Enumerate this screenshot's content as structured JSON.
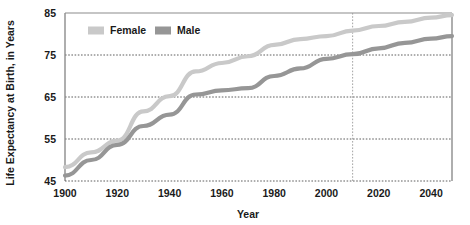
{
  "chart_data": {
    "type": "line",
    "title": "",
    "xlabel": "Year",
    "ylabel": "Life Expectancy at Birth, in Years",
    "xlim": [
      1900,
      2048
    ],
    "ylim": [
      45,
      85
    ],
    "xticks": [
      1900,
      1920,
      1940,
      1960,
      1980,
      2000,
      2020,
      2040
    ],
    "yticks": [
      45,
      55,
      65,
      75,
      85
    ],
    "grid": "horizontal-dotted",
    "legend_position": "top-left-inside",
    "annotations": [
      {
        "name": "projection-divider",
        "type": "vertical-dotted-line",
        "x": 2010
      }
    ],
    "x": [
      1900,
      1910,
      1920,
      1930,
      1940,
      1950,
      1960,
      1970,
      1980,
      1990,
      2000,
      2010,
      2020,
      2030,
      2040,
      2048
    ],
    "series": [
      {
        "name": "Female",
        "color": "#c9c9c9",
        "values": [
          48.3,
          51.8,
          54.6,
          61.6,
          65.2,
          71.1,
          73.1,
          74.7,
          77.4,
          78.8,
          79.5,
          80.8,
          81.9,
          82.9,
          83.9,
          84.5
        ]
      },
      {
        "name": "Male",
        "color": "#969696",
        "values": [
          46.3,
          50.0,
          53.6,
          58.1,
          60.8,
          65.6,
          66.6,
          67.1,
          70.0,
          71.8,
          74.1,
          75.2,
          76.6,
          77.9,
          78.9,
          79.5
        ]
      }
    ]
  },
  "legend": {
    "items": [
      {
        "label": "Female",
        "color": "#c9c9c9"
      },
      {
        "label": "Male",
        "color": "#969696"
      }
    ]
  },
  "axes": {
    "y_title": "Life Expectancy at Birth, in Years",
    "x_title": "Year",
    "y_tick_labels": [
      "45",
      "55",
      "65",
      "75",
      "85"
    ],
    "x_tick_labels": [
      "1900",
      "1920",
      "1940",
      "1960",
      "1980",
      "2000",
      "2020",
      "2040"
    ]
  },
  "colors": {
    "female": "#c9c9c9",
    "male": "#969696",
    "axis": "#8c8c8c",
    "grid": "#4d4d4d",
    "text": "#1a1a1a",
    "background": "#ffffff"
  }
}
